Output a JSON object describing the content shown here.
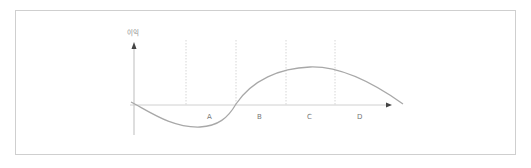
{
  "diagram": {
    "y_axis_label": "이익",
    "regions": [
      {
        "label": "A",
        "x": 210
      },
      {
        "label": "B",
        "x": 260
      },
      {
        "label": "C",
        "x": 310
      },
      {
        "label": "D",
        "x": 360
      }
    ],
    "colors": {
      "frame": "#cfcfcf",
      "axis": "#bdbdbd",
      "curve": "#a8a8a8",
      "dashed": "#cccccc",
      "label": "#777777"
    }
  }
}
